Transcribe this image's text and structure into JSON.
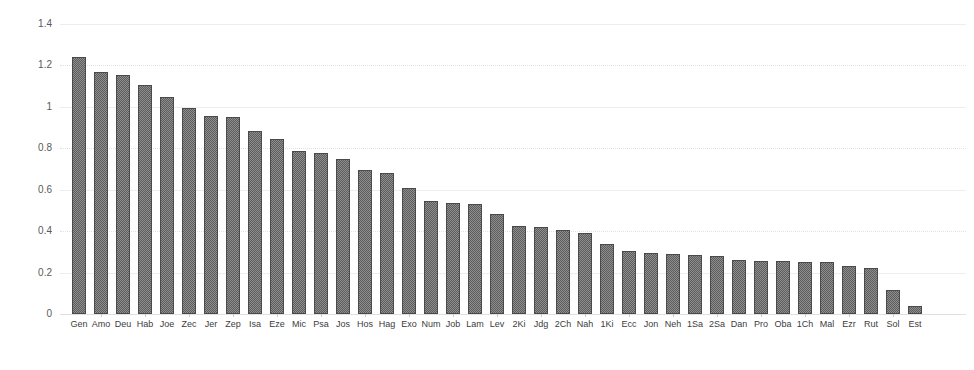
{
  "chart_data": {
    "type": "bar",
    "title": "",
    "xlabel": "",
    "ylabel": "",
    "ylim": [
      0,
      1.4
    ],
    "grid": true,
    "legend": false,
    "yticks": [
      "0",
      "0.2",
      "0.4",
      "0.6",
      "0.8",
      "1",
      "1.2",
      "1.4"
    ],
    "ytick_values": [
      0,
      0.2,
      0.4,
      0.6,
      0.8,
      1.0,
      1.2,
      1.4
    ],
    "bar_color": "#5d5d5d",
    "gridline_color": "#ededed",
    "categories": [
      "Gen",
      "Amo",
      "Deu",
      "Hab",
      "Joe",
      "Zec",
      "Jer",
      "Zep",
      "Isa",
      "Eze",
      "Mic",
      "Psa",
      "Jos",
      "Hos",
      "Hag",
      "Exo",
      "Num",
      "Job",
      "Lam",
      "Lev",
      "2Ki",
      "Jdg",
      "2Ch",
      "Nah",
      "1Ki",
      "Ecc",
      "Jon",
      "Neh",
      "1Sa",
      "2Sa",
      "Dan",
      "Pro",
      "Oba",
      "1Ch",
      "Mal",
      "Ezr",
      "Rut",
      "Sol",
      "Est"
    ],
    "values": [
      1.24,
      1.17,
      1.155,
      1.105,
      1.05,
      0.995,
      0.955,
      0.95,
      0.885,
      0.845,
      0.785,
      0.775,
      0.75,
      0.695,
      0.68,
      0.61,
      0.545,
      0.535,
      0.53,
      0.485,
      0.425,
      0.42,
      0.405,
      0.39,
      0.34,
      0.305,
      0.295,
      0.29,
      0.285,
      0.28,
      0.26,
      0.255,
      0.255,
      0.25,
      0.25,
      0.23,
      0.22,
      0.115,
      0.04
    ]
  }
}
